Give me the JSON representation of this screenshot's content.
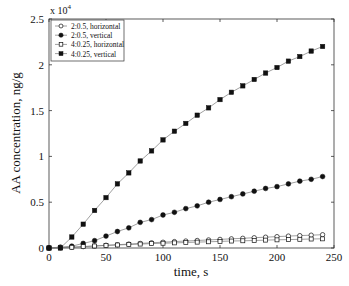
{
  "chart_data": {
    "type": "line",
    "title": "",
    "xlabel": "time, s",
    "ylabel": "AA concentration, ng/g",
    "y_multiplier": "x 10",
    "y_multiplier_exp": "4",
    "xlim": [
      0,
      250
    ],
    "ylim": [
      0,
      2.5
    ],
    "xticks": [
      0,
      50,
      100,
      150,
      200,
      250
    ],
    "xtick_labels": [
      "0",
      "50",
      "100",
      "150",
      "200",
      "250"
    ],
    "yticks": [
      0,
      0.5,
      1,
      1.5,
      2,
      2.5
    ],
    "ytick_labels": [
      "0",
      "0.5",
      "1",
      "1.5",
      "2",
      "2.5"
    ],
    "grid": false,
    "legend_position": "upper left",
    "x": [
      0,
      10,
      20,
      30,
      40,
      50,
      60,
      70,
      80,
      90,
      100,
      110,
      120,
      130,
      140,
      150,
      160,
      170,
      180,
      190,
      200,
      210,
      220,
      230,
      240
    ],
    "series": [
      {
        "name": "2:0.5, horizontal",
        "marker": "open-circle",
        "values": [
          0,
          0.003,
          0.008,
          0.015,
          0.022,
          0.03,
          0.036,
          0.043,
          0.05,
          0.057,
          0.063,
          0.07,
          0.076,
          0.082,
          0.088,
          0.094,
          0.1,
          0.106,
          0.112,
          0.118,
          0.124,
          0.13,
          0.135,
          0.14,
          0.145
        ]
      },
      {
        "name": "2:0.5, vertical",
        "marker": "filled-circle",
        "values": [
          0,
          0.01,
          0.02,
          0.05,
          0.08,
          0.13,
          0.18,
          0.22,
          0.28,
          0.31,
          0.36,
          0.39,
          0.43,
          0.46,
          0.5,
          0.53,
          0.56,
          0.59,
          0.62,
          0.65,
          0.67,
          0.7,
          0.73,
          0.75,
          0.78
        ]
      },
      {
        "name": "4:0.25, horizontal",
        "marker": "open-square",
        "values": [
          0,
          0.003,
          0.008,
          0.015,
          0.022,
          0.028,
          0.033,
          0.038,
          0.043,
          0.048,
          0.052,
          0.056,
          0.06,
          0.064,
          0.068,
          0.072,
          0.076,
          0.079,
          0.082,
          0.086,
          0.089,
          0.092,
          0.095,
          0.098,
          0.1
        ]
      },
      {
        "name": "4:0.25, vertical",
        "marker": "filled-square",
        "values": [
          0,
          0.0,
          0.12,
          0.26,
          0.41,
          0.55,
          0.7,
          0.82,
          0.95,
          1.06,
          1.18,
          1.275,
          1.36,
          1.45,
          1.53,
          1.62,
          1.7,
          1.77,
          1.84,
          1.91,
          1.97,
          2.04,
          2.09,
          2.15,
          2.2
        ]
      }
    ]
  },
  "colors": {
    "axis": "#333333",
    "line": "#777777",
    "marker": "#111111"
  }
}
